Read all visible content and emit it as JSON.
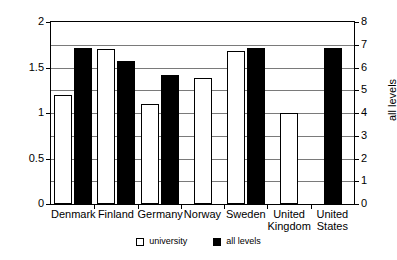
{
  "chart_data": {
    "type": "bar",
    "title": "",
    "subtitle": "",
    "categories": [
      "Denmark",
      "Finland",
      "Germany",
      "Norway",
      "Sweden",
      "United Kingdom",
      "United States"
    ],
    "series": [
      {
        "name": "university",
        "axis": "left",
        "color": "#ffffff",
        "values": [
          1.2,
          1.7,
          1.1,
          1.39,
          1.68,
          1.0,
          null
        ]
      },
      {
        "name": "all levels",
        "axis": "right",
        "color": "#000000",
        "values": [
          6.85,
          6.3,
          5.68,
          null,
          6.87,
          null,
          6.87
        ]
      }
    ],
    "xlabel": "",
    "ylabel": "tertiary",
    "y2label": "all levels",
    "ylim": [
      0,
      2
    ],
    "y2lim": [
      0,
      8
    ],
    "yticks": [
      "0",
      "0.5",
      "1",
      "1.5",
      "2"
    ],
    "ytick_values": [
      0,
      0.5,
      1,
      1.5,
      2
    ],
    "y2ticks": [
      "0",
      "1",
      "2",
      "3",
      "4",
      "5",
      "6",
      "7",
      "8"
    ],
    "y2tick_values": [
      0,
      1,
      2,
      3,
      4,
      5,
      6,
      7,
      8
    ],
    "grid": true,
    "grid_axis": "y",
    "gridline_count": 8,
    "legend_position": "bottom",
    "legend": [
      "university",
      "all levels"
    ]
  },
  "legend": {
    "items": [
      {
        "label": "university",
        "swatch": "university-swatch-icon"
      },
      {
        "label": "all levels",
        "swatch": "all-levels-swatch-icon"
      }
    ]
  },
  "axes": {
    "left_title": "tertiary",
    "right_title": "all levels"
  }
}
